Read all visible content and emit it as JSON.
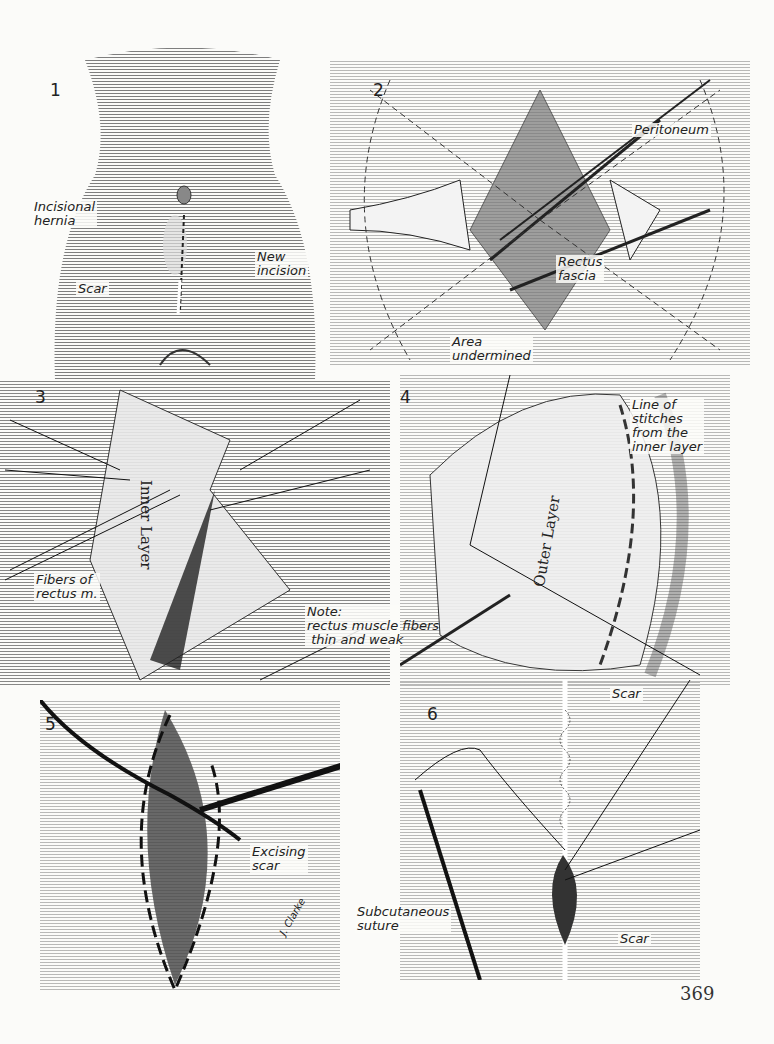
{
  "page": {
    "page_number": "369",
    "signature": "J. Clarke"
  },
  "figures": [
    {
      "number": "1",
      "labels": {
        "incisional_hernia": "Incisional\nhernia",
        "new_incision": "New\nincision",
        "scar": "Scar"
      }
    },
    {
      "number": "2",
      "labels": {
        "peritoneum": "Peritoneum",
        "rectus_fascia": "Rectus\nfascia",
        "area_undermined": "Area\nundermined"
      }
    },
    {
      "number": "3",
      "labels": {
        "inner_layer": "Inner Layer",
        "fibers_of_rectus": "Fibers of\nrectus m.",
        "note": "Note:\nrectus muscle fibers\n thin and weak"
      }
    },
    {
      "number": "4",
      "labels": {
        "outer_layer": "Outer Layer",
        "line_of_stitches": "Line of\nstitches\nfrom the\ninner layer"
      }
    },
    {
      "number": "5",
      "labels": {
        "excising_scar": "Excising\nscar"
      }
    },
    {
      "number": "6",
      "labels": {
        "scar_top": "Scar",
        "subcutaneous_suture": "Subcutaneous\nsuture",
        "scar_bottom": "Scar"
      }
    }
  ]
}
